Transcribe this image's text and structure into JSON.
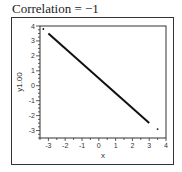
{
  "title": "Correlation = −1",
  "chart_data": {
    "type": "scatter",
    "title": "Correlation = −1",
    "xlabel": "x",
    "ylabel": "y1.00",
    "xlim": [
      -3.5,
      4
    ],
    "ylim": [
      -3.5,
      4
    ],
    "xticks": [
      -3,
      -2,
      -1,
      0,
      1,
      2,
      3,
      4
    ],
    "yticks": [
      -3,
      -2,
      -1,
      0,
      1,
      2,
      3,
      4
    ],
    "grid": false,
    "legend": null,
    "series": [
      {
        "name": "points",
        "description": "dense points along line y = 0.5 - x (perfect negative correlation)",
        "line_start": [
          -3.0,
          3.5
        ],
        "line_end": [
          3.0,
          -2.5
        ],
        "outliers": [
          [
            -3.3,
            3.8
          ],
          [
            3.5,
            -2.9
          ]
        ]
      }
    ],
    "correlation": -1
  }
}
